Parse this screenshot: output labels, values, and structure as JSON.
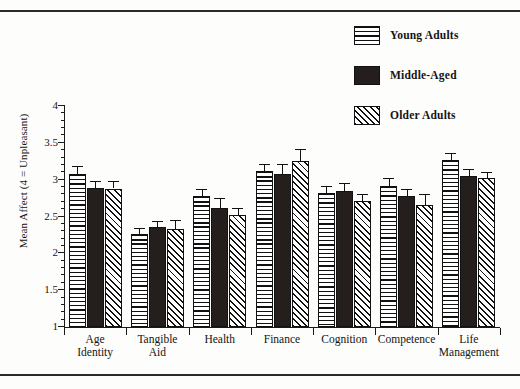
{
  "chart_data": {
    "type": "bar",
    "title": "",
    "xlabel": "",
    "ylabel": "Mean Affect (4 = Unpleasant)",
    "ylim": [
      1,
      4
    ],
    "ytick_labels": [
      "1",
      "1.5",
      "2",
      "2.5",
      "3",
      "3.5",
      "4"
    ],
    "ytick_values": [
      1,
      1.5,
      2,
      2.5,
      3,
      3.5,
      4
    ],
    "grid": false,
    "legend_position": "top-right",
    "categories": [
      "Age Identity",
      "Tangible Aid",
      "Health",
      "Finance",
      "Cognition",
      "Competence",
      "Life Management"
    ],
    "series": [
      {
        "name": "Young Adults",
        "pattern": "horizontal-lines",
        "values": [
          3.08,
          2.26,
          2.78,
          3.12,
          2.82,
          2.91,
          3.27
        ],
        "errors": [
          0.11,
          0.08,
          0.09,
          0.09,
          0.09,
          0.11,
          0.09
        ]
      },
      {
        "name": "Middle-Aged",
        "pattern": "solid-black",
        "values": [
          2.89,
          2.36,
          2.62,
          3.08,
          2.85,
          2.78,
          3.05
        ],
        "errors": [
          0.09,
          0.08,
          0.13,
          0.13,
          0.1,
          0.1,
          0.1
        ]
      },
      {
        "name": "Older Adults",
        "pattern": "diagonal-hatch",
        "values": [
          2.88,
          2.33,
          2.52,
          3.25,
          2.71,
          2.66,
          3.02
        ],
        "errors": [
          0.1,
          0.12,
          0.09,
          0.17,
          0.1,
          0.15,
          0.08
        ]
      }
    ]
  },
  "legend": {
    "items": [
      {
        "label": "Young Adults",
        "swatch": "horizontal-lines-swatch"
      },
      {
        "label": "Middle-Aged",
        "swatch": "solid-black-swatch"
      },
      {
        "label": "Older Adults",
        "swatch": "diagonal-hatch-swatch"
      }
    ]
  },
  "xaxis": {
    "labels": [
      {
        "line1": "Age",
        "line2": "Identity"
      },
      {
        "line1": "Tangible",
        "line2": "Aid"
      },
      {
        "line1": "Health",
        "line2": ""
      },
      {
        "line1": "Finance",
        "line2": ""
      },
      {
        "line1": "Cognition",
        "line2": ""
      },
      {
        "line1": "Competence",
        "line2": ""
      },
      {
        "line1": "Life",
        "line2": "Management"
      }
    ]
  }
}
